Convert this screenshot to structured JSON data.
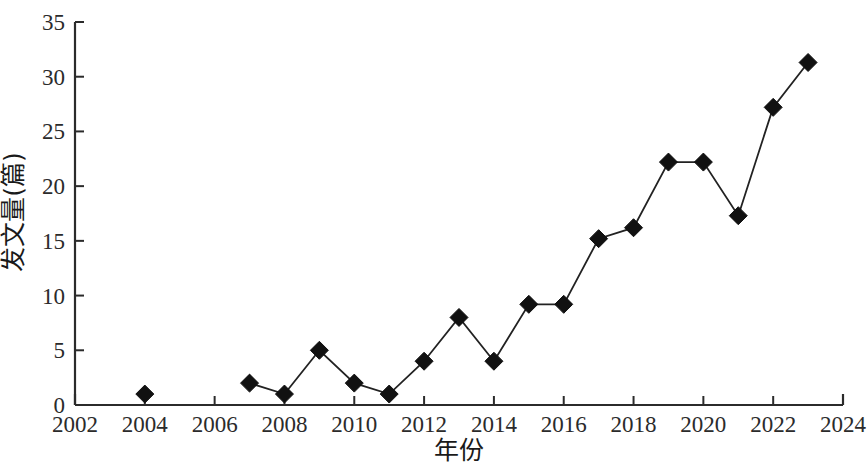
{
  "chart_data": {
    "type": "line",
    "title": "",
    "subtitle": "",
    "xlabel": "年份",
    "ylabel": "发文量(篇)",
    "xlim": [
      2002,
      2024
    ],
    "ylim": [
      0,
      35
    ],
    "xtick_step": 2,
    "ytick_step": 5,
    "grid": false,
    "legend": null,
    "marker": "filled-diamond",
    "marker_color": "#111111",
    "line_color": "#222222",
    "x_ticks": [
      "2002",
      "2004",
      "2006",
      "2008",
      "2010",
      "2012",
      "2014",
      "2016",
      "2018",
      "2020",
      "2022",
      "2024"
    ],
    "y_ticks": [
      "0",
      "5",
      "10",
      "15",
      "20",
      "25",
      "30",
      "35"
    ],
    "series": [
      {
        "name": "发文量(篇) 单点",
        "connected": false,
        "x": [
          2004
        ],
        "values": [
          1
        ]
      },
      {
        "name": "发文量(篇)",
        "connected": true,
        "x": [
          2007,
          2008,
          2009,
          2010,
          2011,
          2012,
          2013,
          2014,
          2015,
          2016,
          2017,
          2018,
          2019,
          2020,
          2021,
          2022,
          2023
        ],
        "values": [
          2,
          1,
          5,
          2,
          1,
          4,
          8,
          4,
          9.2,
          9.2,
          15.2,
          16.2,
          22.2,
          22.2,
          17.3,
          27.2,
          31.3
        ]
      }
    ],
    "points": [
      {
        "x": 2004,
        "y": 1
      },
      {
        "x": 2007,
        "y": 2
      },
      {
        "x": 2008,
        "y": 1
      },
      {
        "x": 2009,
        "y": 5
      },
      {
        "x": 2010,
        "y": 2
      },
      {
        "x": 2011,
        "y": 1
      },
      {
        "x": 2012,
        "y": 4
      },
      {
        "x": 2013,
        "y": 8
      },
      {
        "x": 2014,
        "y": 4
      },
      {
        "x": 2015,
        "y": 9.2
      },
      {
        "x": 2016,
        "y": 9.2
      },
      {
        "x": 2017,
        "y": 15.2
      },
      {
        "x": 2018,
        "y": 16.2
      },
      {
        "x": 2019,
        "y": 22.2
      },
      {
        "x": 2020,
        "y": 22.2
      },
      {
        "x": 2021,
        "y": 17.3
      },
      {
        "x": 2022,
        "y": 27.2
      },
      {
        "x": 2023,
        "y": 31.3
      }
    ]
  },
  "axes": {
    "y_title": "发文量(篇)",
    "x_title": "年份"
  },
  "colors": {
    "axis": "#2b2b2b",
    "line": "#222222",
    "marker": "#111111",
    "background": "#ffffff"
  }
}
